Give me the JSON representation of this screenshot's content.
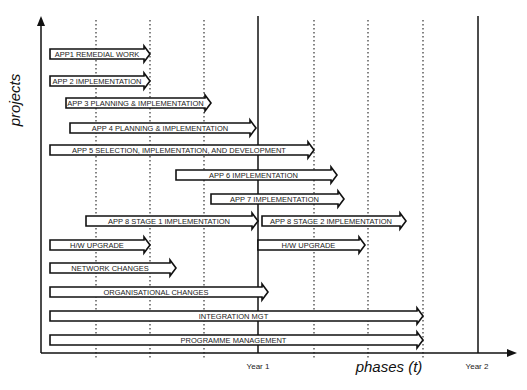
{
  "axes": {
    "y_label": "projects",
    "x_label": "phases (t)",
    "year1": "Year 1",
    "year2": "Year 2"
  },
  "gridlines": {
    "dotted_x": [
      96,
      150,
      204,
      314,
      368,
      423
    ],
    "solid_x": [
      258,
      478
    ]
  },
  "bars": [
    {
      "label": "APP1 REMEDIAL WORK",
      "x1": 50,
      "x2": 150,
      "y": 54
    },
    {
      "label": "APP 2 IMPLEMENTATION",
      "x1": 50,
      "x2": 150,
      "y": 81
    },
    {
      "label": "APP 3 PLANNING & IMPLEMENTATION",
      "x1": 66,
      "x2": 211,
      "y": 103
    },
    {
      "label": "APP 4 PLANNING & IMPLEMENTATION",
      "x1": 70,
      "x2": 256,
      "y": 128
    },
    {
      "label": "APP 5 SELECTION, IMPLEMENTATION, AND DEVELOPMENT",
      "x1": 50,
      "x2": 314,
      "y": 150
    },
    {
      "label": "APP 6 IMPLEMENTATION",
      "x1": 176,
      "x2": 337,
      "y": 175
    },
    {
      "label": "APP 7 IMPLEMENTATION",
      "x1": 211,
      "x2": 344,
      "y": 199
    },
    {
      "label": "APP 8 STAGE 1 IMPLEMENTATION",
      "x1": 86,
      "x2": 258,
      "y": 221
    },
    {
      "label": "APP 8 STAGE 2 IMPLEMENTATION",
      "x1": 262,
      "x2": 406,
      "y": 221
    },
    {
      "label": "H/W UPGRADE",
      "x1": 50,
      "x2": 150,
      "y": 245
    },
    {
      "label": "H/W UPGRADE",
      "x1": 258,
      "x2": 365,
      "y": 245
    },
    {
      "label": "NETWORK CHANGES",
      "x1": 50,
      "x2": 176,
      "y": 268
    },
    {
      "label": "ORGANISATIONAL CHANGES",
      "x1": 50,
      "x2": 268,
      "y": 292
    },
    {
      "label": "INTEGRATION MGT",
      "x1": 50,
      "x2": 423,
      "y": 316
    },
    {
      "label": "PROGRAMME MANAGEMENT",
      "x1": 50,
      "x2": 423,
      "y": 340
    }
  ]
}
